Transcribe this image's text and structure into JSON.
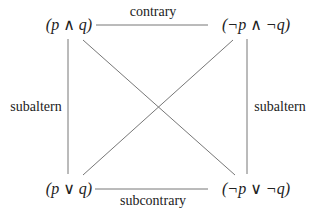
{
  "diagram": {
    "nodes": {
      "top_left": "(p ∧ q)",
      "top_right": "(¬p ∧ ¬q)",
      "bottom_left": "(p ∨ q)",
      "bottom_right": "(¬p ∨ ¬q)"
    },
    "relations": {
      "top": "contrary",
      "bottom": "subcontrary",
      "left": "subaltern",
      "right": "subaltern"
    },
    "line_color": "#777777"
  }
}
